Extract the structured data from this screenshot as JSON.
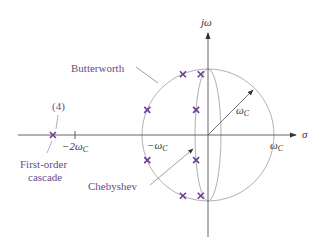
{
  "diagram": {
    "axes": {
      "vertical_label": "jω",
      "horizontal_label": "σ"
    },
    "tick_labels": {
      "neg_two_wc": "−2ω",
      "neg_wc": "−ω",
      "pos_wc": "ω",
      "radius": "ω",
      "subscript": "C"
    },
    "labels": {
      "butterworth": "Butterworth",
      "chebyshev": "Chebyshev",
      "cascade_count": "(4)",
      "cascade_line1": "First-order",
      "cascade_line2": "cascade"
    },
    "colors": {
      "pole": "#6a3d9a",
      "label": "#6a4a8c",
      "curve": "#a0a0a0",
      "axis": "#555555"
    },
    "poles_units": {
      "butterworth": [
        [
          -0.92,
          0.38
        ],
        [
          -0.38,
          0.92
        ],
        [
          -0.92,
          -0.38
        ],
        [
          -0.38,
          -0.92
        ]
      ],
      "chebyshev": [
        [
          -0.18,
          0.38
        ],
        [
          -0.11,
          0.92
        ],
        [
          -0.18,
          -0.38
        ],
        [
          -0.11,
          -0.92
        ]
      ],
      "cascade": [
        [
          -2.35,
          0
        ]
      ]
    }
  }
}
